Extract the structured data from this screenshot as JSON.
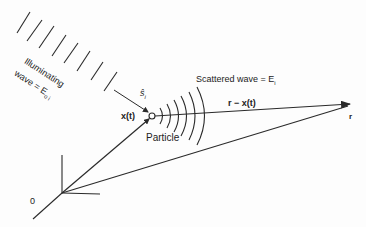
{
  "diagram": {
    "labels": {
      "illuminating_line1": "Illuminating",
      "illuminating_line2": "wave = E",
      "illuminating_sub": "o i",
      "unit_vector": "ŝ",
      "unit_vector_sub": "i",
      "position": "x(t)",
      "particle": "Particle",
      "scattered": "Scattered wave = E",
      "scattered_sub": "i",
      "relative": "r − x(t)",
      "observation": "r",
      "origin": "0"
    },
    "colors": {
      "line": "#2a2a2a",
      "background": "#fdfdfd"
    }
  }
}
